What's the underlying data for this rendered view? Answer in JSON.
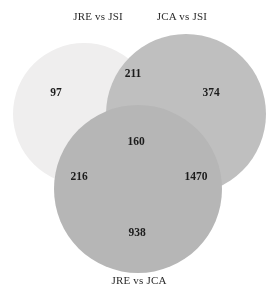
{
  "figure": {
    "type": "venn3",
    "background_color": "#ffffff",
    "width": 278,
    "height": 296
  },
  "labels": {
    "top_left": "JRE vs JSI",
    "top_right": "JCA vs JSI",
    "bottom": "JRE vs JCA"
  },
  "sets": [
    {
      "id": "jre_vs_jsi",
      "label": "JRE vs JSI",
      "position": "top-left",
      "color": "#efeeee",
      "cx": 84,
      "cy": 114,
      "r": 71
    },
    {
      "id": "jca_vs_jsi",
      "label": "JCA vs JSI",
      "position": "top-right",
      "color": "#bfbfbf",
      "cx": 186,
      "cy": 114,
      "r": 80
    },
    {
      "id": "jre_vs_jca",
      "label": "JRE vs JCA",
      "position": "bottom",
      "color": "#b6b6b6",
      "cx": 138,
      "cy": 189,
      "r": 84
    }
  ],
  "chart_data": {
    "type": "venn",
    "title": "",
    "set_labels": [
      "JRE vs JSI",
      "JCA vs JSI",
      "JRE vs JCA"
    ],
    "regions": [
      {
        "key": "100",
        "sets": [
          "JRE vs JSI"
        ],
        "label": "97",
        "value": 97,
        "x": 56,
        "y": 92
      },
      {
        "key": "110",
        "sets": [
          "JRE vs JSI",
          "JCA vs JSI"
        ],
        "label": "211",
        "value": 211,
        "x": 133,
        "y": 73
      },
      {
        "key": "010",
        "sets": [
          "JCA vs JSI"
        ],
        "label": "374",
        "value": 374,
        "x": 211,
        "y": 92
      },
      {
        "key": "111",
        "sets": [
          "JRE vs JSI",
          "JCA vs JSI",
          "JRE vs JCA"
        ],
        "label": "160",
        "value": 160,
        "x": 136,
        "y": 141
      },
      {
        "key": "101",
        "sets": [
          "JRE vs JSI",
          "JRE vs JCA"
        ],
        "label": "216",
        "value": 216,
        "x": 79,
        "y": 176
      },
      {
        "key": "011",
        "sets": [
          "JCA vs JSI",
          "JRE vs JCA"
        ],
        "label": "1470",
        "value": 1470,
        "x": 196,
        "y": 176
      },
      {
        "key": "001",
        "sets": [
          "JRE vs JCA"
        ],
        "label": "938",
        "value": 938,
        "x": 137,
        "y": 232
      }
    ],
    "total": 3466,
    "legend": "none",
    "grid": false
  }
}
